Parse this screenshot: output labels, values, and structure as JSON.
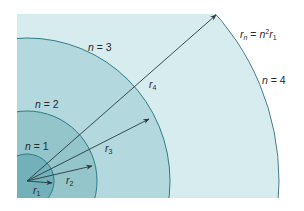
{
  "diagram": {
    "formula": {
      "lhs_var": "r",
      "lhs_sub": "n",
      "equals": " = ",
      "rhs_var": "n",
      "rhs_sup": "2",
      "rhs_var2": "r",
      "rhs_sub": "1"
    },
    "regions": [
      {
        "label_var": "n",
        "label_eq": " = 1",
        "color": "#6fb0b8"
      },
      {
        "label_var": "n",
        "label_eq": " = 2",
        "color": "#8fc3ca"
      },
      {
        "label_var": "n",
        "label_eq": " = 3",
        "color": "#b5d9de"
      },
      {
        "label_var": "n",
        "label_eq": " = 4",
        "color": "#d7ecef"
      }
    ],
    "vectors": [
      {
        "var": "r",
        "sub": "1"
      },
      {
        "var": "r",
        "sub": "2"
      },
      {
        "var": "r",
        "sub": "3"
      },
      {
        "var": "r",
        "sub": "4"
      }
    ],
    "colors": {
      "arc_stroke": "#2f7d86",
      "outer_arc_stroke": "#3a6f78",
      "arrow": "#2b3a40",
      "background": "#ffffff"
    }
  }
}
